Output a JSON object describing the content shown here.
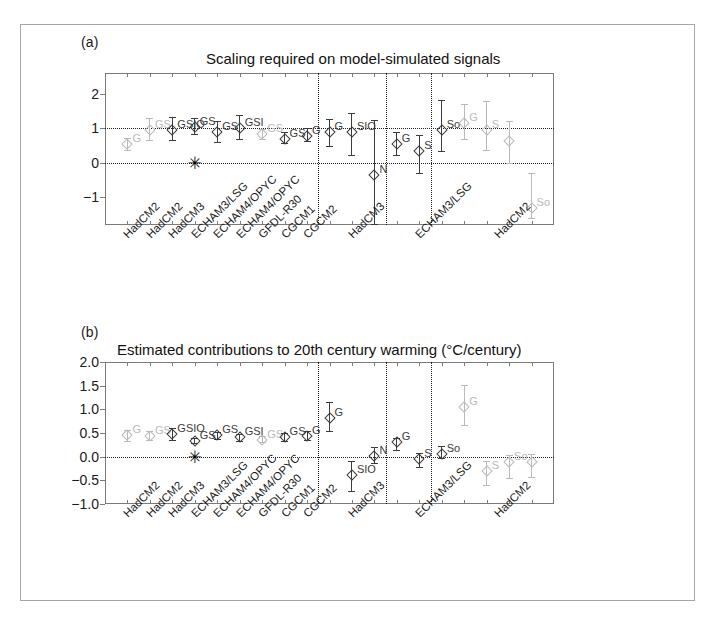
{
  "figure": {
    "background": "#ffffff",
    "frame_color": "#a6a6a6",
    "axis_color": "#7b7b7b",
    "dark_color": "#3b3b3b",
    "light_color": "#b9b9b9",
    "ref_line_color": "#222222",
    "star_glyph": "✳"
  },
  "panels": [
    {
      "letter": "(a)",
      "title": "Scaling required on model-simulated signals",
      "star_marker_label": "observation-reference-star"
    },
    {
      "letter": "(b)",
      "title": "Estimated contributions to 20th century warming (°C/century)",
      "star_marker_label": "observation-reference-star"
    }
  ],
  "chart_data": [
    {
      "type": "scatter",
      "panel": "(a)",
      "title": "Scaling required on model-simulated signals",
      "xlabel": "",
      "ylabel": "",
      "ylim": [
        -1.8,
        2.6
      ],
      "yticks": [
        -1,
        0,
        1,
        2
      ],
      "ytick_labels": [
        "-1",
        "0",
        "1",
        "2"
      ],
      "grid": false,
      "hlines": [
        0,
        1
      ],
      "group_separators_after_index": [
        8,
        11,
        13
      ],
      "xtick_labels": [
        "HadCM2",
        "HadCM2",
        "HadCM3",
        "ECHAM3/LSG",
        "ECHAM4/OPYC",
        "ECHAM4/OPYC",
        "GFDL-R30",
        "CGCM1",
        "CGCM2",
        "HadCM3",
        "ECHAM3/LSG",
        "HadCM2"
      ],
      "points": [
        {
          "group": 1,
          "x": 1,
          "label": "G",
          "value": 0.55,
          "low": 0.37,
          "high": 0.73,
          "shade": "light"
        },
        {
          "group": 1,
          "x": 2,
          "label": "GS",
          "value": 0.95,
          "low": 0.65,
          "high": 1.3,
          "shade": "light"
        },
        {
          "group": 1,
          "x": 3,
          "label": "GSIO",
          "value": 0.95,
          "low": 0.65,
          "high": 1.32,
          "shade": "dark"
        },
        {
          "group": 1,
          "x": 4,
          "label": "GS",
          "value": 1.03,
          "low": 0.82,
          "high": 1.3,
          "shade": "dark"
        },
        {
          "group": 1,
          "x": 5,
          "label": "GS",
          "value": 0.88,
          "low": 0.6,
          "high": 1.22,
          "shade": "dark"
        },
        {
          "group": 1,
          "x": 6,
          "label": "GSI",
          "value": 1.0,
          "low": 0.68,
          "high": 1.38,
          "shade": "dark"
        },
        {
          "group": 1,
          "x": 7,
          "label": "GS",
          "value": 0.82,
          "low": 0.7,
          "high": 0.98,
          "shade": "light"
        },
        {
          "group": 1,
          "x": 8,
          "label": "GS",
          "value": 0.7,
          "low": 0.56,
          "high": 0.88,
          "shade": "dark"
        },
        {
          "group": 1,
          "x": 9,
          "label": "G",
          "value": 0.78,
          "low": 0.62,
          "high": 1.02,
          "shade": "dark"
        },
        {
          "group": 2,
          "x": 10,
          "label": "G",
          "value": 0.88,
          "low": 0.5,
          "high": 1.28,
          "shade": "dark"
        },
        {
          "group": 2,
          "x": 11,
          "label": "SIO",
          "value": 0.9,
          "low": 0.22,
          "high": 1.45,
          "shade": "dark"
        },
        {
          "group": 2,
          "x": 12,
          "label": "N",
          "value": -0.35,
          "low": -1.8,
          "high": 1.25,
          "shade": "dark"
        },
        {
          "group": 3,
          "x": 13,
          "label": "G",
          "value": 0.55,
          "low": 0.22,
          "high": 0.88,
          "shade": "dark"
        },
        {
          "group": 3,
          "x": 14,
          "label": "S",
          "value": 0.33,
          "low": -0.3,
          "high": 0.8,
          "shade": "dark"
        },
        {
          "group": 3,
          "x": 15,
          "label": "So",
          "value": 0.95,
          "low": 0.35,
          "high": 1.82,
          "shade": "dark"
        },
        {
          "group": 4,
          "x": 16,
          "label": "G",
          "value": 1.15,
          "low": 0.7,
          "high": 1.7,
          "shade": "light"
        },
        {
          "group": 4,
          "x": 17,
          "label": "S",
          "value": 0.95,
          "low": 0.38,
          "high": 1.8,
          "shade": "light"
        },
        {
          "group": 4,
          "x": 18,
          "label": "",
          "value": 0.62,
          "low": -0.02,
          "high": 1.2,
          "shade": "light"
        },
        {
          "group": 4,
          "x": 19,
          "label": "So",
          "value": -1.3,
          "low": -1.6,
          "high": -0.3,
          "shade": "light"
        }
      ]
    },
    {
      "type": "scatter",
      "panel": "(b)",
      "title": "Estimated contributions to 20th century warming (°C/century)",
      "xlabel": "",
      "ylabel": "°C/century",
      "ylim": [
        -1.0,
        2.0
      ],
      "yticks": [
        -1.0,
        -0.5,
        0.0,
        0.5,
        1.0,
        1.5,
        2.0
      ],
      "ytick_labels": [
        "-1.0",
        "-0.5",
        "0.0",
        "0.5",
        "1.0",
        "1.5",
        "2.0"
      ],
      "grid": false,
      "hlines": [
        0.0
      ],
      "group_separators_after_index": [
        8,
        11,
        13
      ],
      "xtick_labels": [
        "HadCM2",
        "HadCM2",
        "HadCM3",
        "ECHAM3/LSG",
        "ECHAM4/OPYC",
        "ECHAM4/OPYC",
        "GFDL-R30",
        "CGCM1",
        "CGCM2",
        "HadCM3",
        "ECHAM3/LSG",
        "HadCM2"
      ],
      "points": [
        {
          "group": 1,
          "x": 1,
          "label": "G",
          "value": 0.45,
          "low": 0.33,
          "high": 0.56,
          "shade": "light"
        },
        {
          "group": 1,
          "x": 2,
          "label": "GS",
          "value": 0.44,
          "low": 0.35,
          "high": 0.55,
          "shade": "light"
        },
        {
          "group": 1,
          "x": 3,
          "label": "GSIO",
          "value": 0.48,
          "low": 0.36,
          "high": 0.6,
          "shade": "dark"
        },
        {
          "group": 1,
          "x": 4,
          "label": "GS",
          "value": 0.34,
          "low": 0.28,
          "high": 0.4,
          "shade": "dark"
        },
        {
          "group": 1,
          "x": 5,
          "label": "GS",
          "value": 0.45,
          "low": 0.38,
          "high": 0.53,
          "shade": "dark"
        },
        {
          "group": 1,
          "x": 6,
          "label": "GSI",
          "value": 0.41,
          "low": 0.34,
          "high": 0.48,
          "shade": "dark"
        },
        {
          "group": 1,
          "x": 7,
          "label": "GS",
          "value": 0.36,
          "low": 0.3,
          "high": 0.43,
          "shade": "light"
        },
        {
          "group": 1,
          "x": 8,
          "label": "GS",
          "value": 0.41,
          "low": 0.33,
          "high": 0.5,
          "shade": "dark"
        },
        {
          "group": 1,
          "x": 9,
          "label": "G",
          "value": 0.44,
          "low": 0.35,
          "high": 0.54,
          "shade": "dark"
        },
        {
          "group": 2,
          "x": 10,
          "label": "G",
          "value": 0.82,
          "low": 0.55,
          "high": 1.15,
          "shade": "dark"
        },
        {
          "group": 2,
          "x": 11,
          "label": "SIO",
          "value": -0.38,
          "low": -0.72,
          "high": -0.1,
          "shade": "dark"
        },
        {
          "group": 2,
          "x": 12,
          "label": "N",
          "value": 0.02,
          "low": -0.14,
          "high": 0.2,
          "shade": "dark"
        },
        {
          "group": 3,
          "x": 13,
          "label": "G",
          "value": 0.3,
          "low": 0.14,
          "high": 0.4,
          "shade": "dark"
        },
        {
          "group": 3,
          "x": 14,
          "label": "S",
          "value": -0.05,
          "low": -0.22,
          "high": 0.08,
          "shade": "dark"
        },
        {
          "group": 3,
          "x": 15,
          "label": "So",
          "value": 0.05,
          "low": -0.03,
          "high": 0.22,
          "shade": "dark"
        },
        {
          "group": 4,
          "x": 16,
          "label": "G",
          "value": 1.05,
          "low": 0.67,
          "high": 1.52,
          "shade": "light"
        },
        {
          "group": 4,
          "x": 17,
          "label": "S",
          "value": -0.3,
          "low": -0.6,
          "high": -0.1,
          "shade": "light"
        },
        {
          "group": 4,
          "x": 18,
          "label": "So",
          "value": -0.12,
          "low": -0.45,
          "high": 0.03,
          "shade": "light"
        },
        {
          "group": 4,
          "x": 19,
          "label": "",
          "value": -0.12,
          "low": -0.42,
          "high": 0.05,
          "shade": "light"
        }
      ]
    }
  ]
}
